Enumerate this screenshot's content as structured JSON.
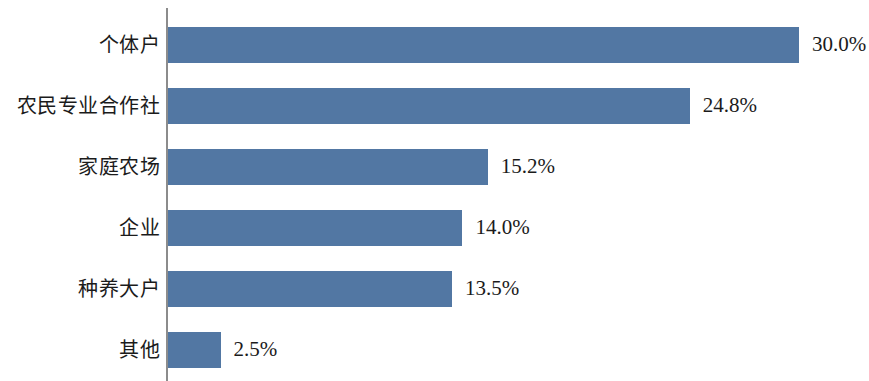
{
  "chart_data": {
    "type": "bar",
    "orientation": "horizontal",
    "title": "",
    "subtitle": "",
    "xlabel": "",
    "ylabel": "",
    "grid": false,
    "legend": false,
    "legend_position": "none",
    "xlim": [
      0,
      30
    ],
    "categories": [
      "个体户",
      "农民专业合作社",
      "家庭农场",
      "企业",
      "种养大户",
      "其他"
    ],
    "values": [
      30.0,
      24.8,
      15.2,
      14.0,
      13.5,
      2.5
    ],
    "value_labels": [
      "30.0%",
      "24.8%",
      "15.2%",
      "14.0%",
      "13.5%",
      "2.5%"
    ],
    "bar_color": "#5277a3",
    "axis_color": "#8c8c8c",
    "background_color": "#ffffff",
    "text_color": "#1b1b1b",
    "bars": [
      {
        "category": "个体户",
        "value": 30.0,
        "label": "30.0%"
      },
      {
        "category": "农民专业合作社",
        "value": 24.8,
        "label": "24.8%"
      },
      {
        "category": "家庭农场",
        "value": 15.2,
        "label": "15.2%"
      },
      {
        "category": "企业",
        "value": 14.0,
        "label": "14.0%"
      },
      {
        "category": "种养大户",
        "value": 13.5,
        "label": "13.5%"
      },
      {
        "category": "其他",
        "value": 2.5,
        "label": "2.5%"
      }
    ]
  }
}
